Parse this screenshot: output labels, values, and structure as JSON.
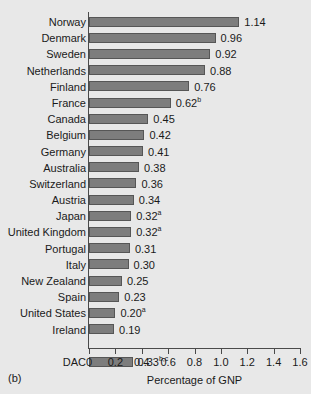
{
  "panel": {
    "label": "(b)"
  },
  "chart_data": {
    "type": "bar",
    "orientation": "horizontal",
    "title": "",
    "xlabel": "Percentage of GNP",
    "ylabel": "",
    "xlim": [
      0,
      1.6
    ],
    "xticks": [
      "0",
      "0.2",
      "0.4",
      "0.6",
      "0.8",
      "1.0",
      "1.2",
      "1.4",
      "1.6"
    ],
    "xtick_values": [
      0,
      0.2,
      0.4,
      0.6,
      0.8,
      1.0,
      1.2,
      1.4,
      1.6
    ],
    "grid": false,
    "legend": null,
    "bar_color": "#7d7d7d",
    "bar_edge_color": "#565656",
    "background_color": "#e8e8e8",
    "categories": [
      "Norway",
      "Denmark",
      "Sweden",
      "Netherlands",
      "Finland",
      "France",
      "Canada",
      "Belgium",
      "Germany",
      "Australia",
      "Switzerland",
      "Austria",
      "Japan",
      "United Kingdom",
      "Portugal",
      "Italy",
      "New Zealand",
      "Spain",
      "United States",
      "Ireland",
      "DAC"
    ],
    "values": [
      1.14,
      0.96,
      0.92,
      0.88,
      0.76,
      0.62,
      0.45,
      0.42,
      0.41,
      0.38,
      0.36,
      0.34,
      0.32,
      0.32,
      0.31,
      0.3,
      0.25,
      0.23,
      0.2,
      0.19,
      0.33
    ],
    "data_labels": [
      "1.14",
      "0.96",
      "0.92",
      "0.88",
      "0.76",
      "0.62",
      "0.45",
      "0.42",
      "0.41",
      "0.38",
      "0.36",
      "0.34",
      "0.32",
      "0.32",
      "0.31",
      "0.30",
      "0.25",
      "0.23",
      "0.20",
      "0.19",
      "0.33"
    ],
    "footnote_markers": [
      "",
      "",
      "",
      "",
      "",
      "b",
      "",
      "",
      "",
      "",
      "",
      "",
      "a",
      "a",
      "",
      "",
      "",
      "",
      "a",
      "",
      "b,c"
    ],
    "separated_after_index": 19
  }
}
